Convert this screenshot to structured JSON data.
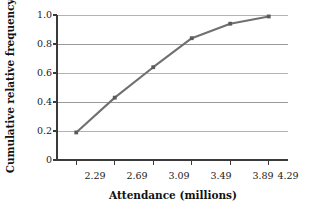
{
  "chart_data": {
    "type": "line",
    "title": "",
    "subtitle": "",
    "xlabel": "Attendance (millions)",
    "ylabel": "Cumulative relative frequency",
    "x": [
      2.29,
      2.69,
      3.09,
      3.49,
      3.89,
      4.29
    ],
    "values": [
      0.19,
      0.43,
      0.64,
      0.84,
      0.94,
      0.99
    ],
    "series": [
      {
        "name": "Cumulative relative frequency",
        "values": [
          0.19,
          0.43,
          0.64,
          0.84,
          0.94,
          0.99
        ]
      }
    ],
    "xtick_labels": [
      "2.29",
      "2.69",
      "3.09",
      "3.49",
      "3.89",
      "4.29"
    ],
    "ytick_labels": [
      "0",
      "0.2",
      "0.4",
      "0.6",
      "0.8",
      "1.0"
    ],
    "ytick_values": [
      0,
      0.2,
      0.4,
      0.6,
      0.8,
      1.0
    ],
    "xlim": [
      2.09,
      4.49
    ],
    "ylim": [
      0,
      1.0
    ],
    "grid": true,
    "grid_axis": "y",
    "legend": "none",
    "markers": true,
    "line_color": "#707070",
    "marker_color": "#5a5a5a",
    "grid_color": "#9a9a9a",
    "axis_color": "#3a3a3a",
    "background_color": "#ffffff",
    "annotations": []
  }
}
